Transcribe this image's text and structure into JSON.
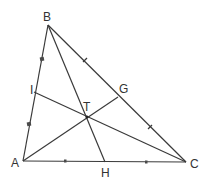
{
  "diagram": {
    "points": {
      "A": {
        "label": "A",
        "x": 23,
        "y": 161
      },
      "B": {
        "label": "B",
        "x": 48,
        "y": 25
      },
      "C": {
        "label": "C",
        "x": 186,
        "y": 162
      },
      "I": {
        "label": "I",
        "x": 34,
        "y": 92
      },
      "G": {
        "label": "G",
        "x": 118,
        "y": 97
      },
      "H": {
        "label": "H",
        "x": 105,
        "y": 162
      },
      "T": {
        "label": "T",
        "x": 87,
        "y": 117
      }
    },
    "segments": [
      {
        "from": "A",
        "to": "B"
      },
      {
        "from": "B",
        "to": "C"
      },
      {
        "from": "A",
        "to": "C"
      },
      {
        "from": "B",
        "to": "H"
      },
      {
        "from": "A",
        "to": "G"
      },
      {
        "from": "I",
        "to": "C"
      }
    ],
    "tick_marks": [
      {
        "on": "AB",
        "count": 2,
        "positions": [
          [
            42,
            59
          ],
          [
            29,
            124
          ]
        ]
      },
      {
        "on": "BC",
        "count": 2,
        "positions": [
          [
            85,
            60
          ],
          [
            150,
            127
          ]
        ]
      },
      {
        "on": "AC",
        "count": 2,
        "positions": [
          [
            65,
            161
          ],
          [
            146,
            162
          ]
        ]
      }
    ],
    "colors": {
      "line": "#3a3a3a",
      "label": "#333333",
      "background": "#ffffff"
    }
  }
}
